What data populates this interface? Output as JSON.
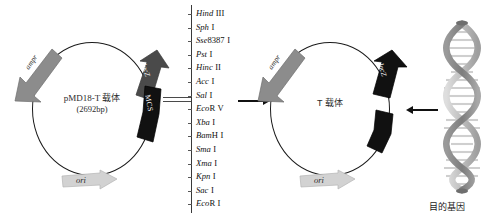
{
  "figure": {
    "title_visible": false
  },
  "left_plasmid": {
    "name": "pMD18-T 载体",
    "size": "(2692bp)",
    "features": {
      "ampr": "ampr",
      "lacz": "lacZ",
      "mcs": "MCS",
      "ori": "ori"
    }
  },
  "enzyme_list": {
    "items": [
      {
        "name": "Hind",
        "suffix": "",
        "num": "III"
      },
      {
        "name": "Sph",
        "suffix": "",
        "num": "I"
      },
      {
        "name": "Sse",
        "suffix": "8387",
        "num": "I"
      },
      {
        "name": "Pst",
        "suffix": "",
        "num": "I"
      },
      {
        "name": "Hinc",
        "suffix": "",
        "num": "II"
      },
      {
        "name": "Acc",
        "suffix": "",
        "num": "I"
      },
      {
        "name": "Sal",
        "suffix": "",
        "num": "I"
      },
      {
        "name": "Eco",
        "suffix": "R",
        "num": "V"
      },
      {
        "name": "Xba",
        "suffix": "",
        "num": "I"
      },
      {
        "name": "Bam",
        "suffix": "H",
        "num": "I"
      },
      {
        "name": "Sma",
        "suffix": "",
        "num": "I"
      },
      {
        "name": "Xma",
        "suffix": "",
        "num": "I"
      },
      {
        "name": "Kpn",
        "suffix": "",
        "num": "I"
      },
      {
        "name": "Sac",
        "suffix": "",
        "num": "I"
      },
      {
        "name": "Eco",
        "suffix": "R",
        "num": "I"
      }
    ]
  },
  "right_plasmid": {
    "name": "T 载体",
    "features": {
      "ampr": "ampr",
      "lacz": "lacZ",
      "ori": "ori"
    }
  },
  "target_gene": {
    "label": "目的基因"
  },
  "colors": {
    "outline": "#1a1a1a",
    "ampr_fill": "#8c8c8c",
    "lacz_fill": "#4a4a4a",
    "mcs_fill": "#111111",
    "ori_fill": "#d2d2d2",
    "lacz_dark_fill": "#111111",
    "helix_light": "#c9c9c9",
    "helix_dark": "#8e8e8e",
    "arrow": "#111111"
  }
}
